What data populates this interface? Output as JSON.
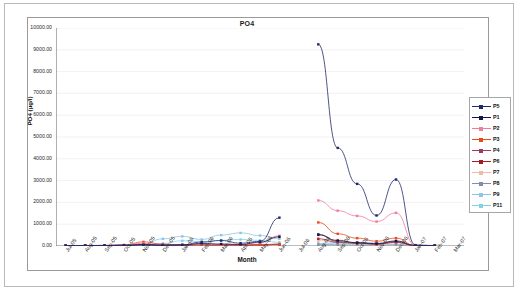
{
  "chart_data": {
    "type": "line",
    "title": "PO4",
    "xlabel": "Month",
    "ylabel": "PO4 (µg/l)",
    "ylim": [
      0,
      10000
    ],
    "ytick_step": 1000,
    "ytick_labels": [
      "0.00",
      "1000.00",
      "2000.00",
      "3000.00",
      "4000.00",
      "5000.00",
      "6000.00",
      "7000.00",
      "8000.00",
      "9000.00",
      "10000.00"
    ],
    "grid": true,
    "legend_position": "right",
    "categories": [
      "Jul-05",
      "Aug-05",
      "Sep-05",
      "Oct-05",
      "Nov-05",
      "Dec-05",
      "Jan-06",
      "Feb-06",
      "Mar-06",
      "Apr-06",
      "May-06",
      "Jun-06",
      "Jul-06",
      "Aug-06",
      "Sep-06",
      "Oct-06",
      "Nov-06",
      "Dec-06",
      "Jan-07",
      "Feb-07",
      "Mar-07"
    ],
    "series": [
      {
        "name": "P5",
        "color": "#1f2a6b",
        "values": [
          20,
          20,
          25,
          30,
          60,
          40,
          55,
          180,
          250,
          130,
          210,
          1300,
          null,
          9250,
          4500,
          2850,
          1400,
          3050,
          40,
          25,
          null
        ]
      },
      {
        "name": "P1",
        "color": "#11174a",
        "values": [
          15,
          18,
          20,
          35,
          45,
          35,
          40,
          120,
          90,
          70,
          180,
          420,
          null,
          510,
          250,
          150,
          110,
          230,
          30,
          20,
          null
        ]
      },
      {
        "name": "P2",
        "color": "#ee7f9a",
        "values": [
          20,
          22,
          30,
          45,
          120,
          60,
          45,
          90,
          60,
          55,
          150,
          470,
          null,
          2090,
          1620,
          1380,
          1120,
          1520,
          25,
          20,
          null
        ]
      },
      {
        "name": "P3",
        "color": "#e8491d",
        "values": [
          18,
          20,
          25,
          40,
          190,
          80,
          50,
          60,
          45,
          40,
          60,
          90,
          null,
          1080,
          560,
          360,
          220,
          360,
          20,
          18,
          null
        ]
      },
      {
        "name": "P4",
        "color": "#9b3a60",
        "values": [
          16,
          18,
          22,
          30,
          70,
          55,
          40,
          65,
          50,
          35,
          55,
          75,
          null,
          540,
          200,
          150,
          95,
          200,
          22,
          16,
          null
        ]
      },
      {
        "name": "P6",
        "color": "#a51d21",
        "values": [
          14,
          16,
          20,
          28,
          65,
          50,
          38,
          55,
          45,
          30,
          50,
          70,
          null,
          330,
          170,
          120,
          80,
          170,
          18,
          14,
          null
        ]
      },
      {
        "name": "P7",
        "color": "#f0b8a8",
        "values": [
          12,
          14,
          18,
          24,
          60,
          45,
          35,
          50,
          40,
          28,
          45,
          60,
          null,
          240,
          280,
          140,
          70,
          150,
          16,
          12,
          null
        ]
      },
      {
        "name": "P8",
        "color": "#7f8fa6",
        "values": [
          10,
          12,
          16,
          22,
          55,
          40,
          30,
          45,
          35,
          25,
          40,
          55,
          null,
          60,
          55,
          50,
          45,
          60,
          14,
          10,
          null
        ]
      },
      {
        "name": "P9",
        "color": "#8fc3e8",
        "values": [
          10,
          14,
          25,
          45,
          100,
          330,
          440,
          300,
          500,
          600,
          480,
          330,
          null,
          120,
          150,
          170,
          140,
          200,
          20,
          12,
          null
        ]
      },
      {
        "name": "P11",
        "color": "#7fd3e8",
        "values": [
          8,
          10,
          14,
          20,
          50,
          120,
          240,
          200,
          260,
          300,
          260,
          170,
          null,
          90,
          100,
          130,
          110,
          140,
          15,
          10,
          null
        ]
      }
    ]
  },
  "legend": {
    "items": [
      {
        "label": "P5"
      },
      {
        "label": "P1"
      },
      {
        "label": "P2"
      },
      {
        "label": "P3"
      },
      {
        "label": "P4"
      },
      {
        "label": "P6"
      },
      {
        "label": "P7"
      },
      {
        "label": "P8"
      },
      {
        "label": "P9"
      },
      {
        "label": "P11"
      }
    ]
  }
}
